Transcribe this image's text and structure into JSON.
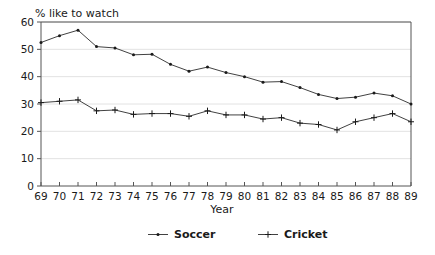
{
  "chart_data": {
    "type": "line",
    "title": "",
    "ylabel": "% like to watch",
    "xlabel": "Year",
    "ylim": [
      0,
      60
    ],
    "yticks": [
      0,
      10,
      20,
      30,
      40,
      50,
      60
    ],
    "grid": true,
    "legend_position": "bottom",
    "categories": [
      "69",
      "70",
      "71",
      "72",
      "73",
      "74",
      "75",
      "76",
      "77",
      "78",
      "79",
      "80",
      "81",
      "82",
      "83",
      "84",
      "85",
      "86",
      "87",
      "88",
      "89"
    ],
    "series": [
      {
        "name": "Soccer",
        "marker": "dot",
        "values": [
          52.5,
          55.0,
          57.0,
          51.0,
          50.5,
          48.0,
          48.2,
          44.5,
          42.0,
          43.5,
          41.5,
          40.0,
          38.0,
          38.2,
          36.0,
          33.5,
          32.0,
          32.5,
          34.0,
          33.0,
          30.0
        ]
      },
      {
        "name": "Cricket",
        "marker": "plus",
        "values": [
          30.5,
          31.0,
          31.5,
          27.5,
          27.8,
          26.2,
          26.5,
          26.5,
          25.5,
          27.5,
          26.0,
          26.0,
          24.5,
          25.0,
          23.0,
          22.5,
          20.5,
          23.5,
          25.0,
          26.5,
          23.5
        ]
      }
    ]
  },
  "colors": {
    "line": "#2b2b2b",
    "grid": "#e2e2e2",
    "axis": "#555555",
    "background": "#ffffff"
  },
  "legend": {
    "items": [
      {
        "label": "Soccer",
        "marker": "dot"
      },
      {
        "label": "Cricket",
        "marker": "plus"
      }
    ]
  }
}
